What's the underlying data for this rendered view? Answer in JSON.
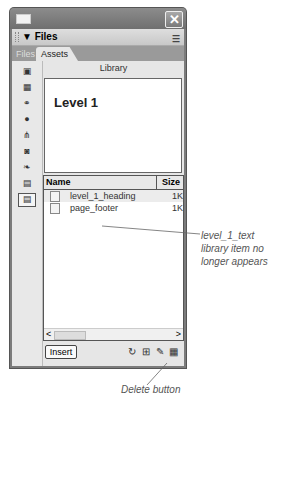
{
  "window": {
    "close_glyph": "✕"
  },
  "panel": {
    "title": "▼ Files",
    "options_glyph": "☰"
  },
  "tabs": [
    {
      "label": "Files",
      "active": false
    },
    {
      "label": "Assets",
      "active": true
    }
  ],
  "sidebar": {
    "icons": [
      {
        "name": "images-icon",
        "glyph": "▣"
      },
      {
        "name": "colors-icon",
        "glyph": "▦"
      },
      {
        "name": "urls-icon",
        "glyph": "⚭"
      },
      {
        "name": "flash-icon",
        "glyph": "●"
      },
      {
        "name": "shockwave-icon",
        "glyph": "⋔"
      },
      {
        "name": "movies-icon",
        "glyph": "◙"
      },
      {
        "name": "scripts-icon",
        "glyph": "❧"
      },
      {
        "name": "templates-icon",
        "glyph": "▤"
      },
      {
        "name": "library-icon",
        "glyph": "📖"
      }
    ]
  },
  "library": {
    "label": "Library",
    "preview_text": "Level 1",
    "columns": {
      "name": "Name",
      "size": "Size"
    },
    "items": [
      {
        "name": "level_1_heading",
        "size": "1K",
        "selected": true
      },
      {
        "name": "page_footer",
        "size": "1K",
        "selected": false
      }
    ],
    "scroll_left": "<",
    "scroll_thumb": "III",
    "scroll_right": ">"
  },
  "bottom_bar": {
    "insert_label": "Insert",
    "refresh_glyph": "↻",
    "new_item_glyph": "⊞",
    "edit_glyph": "✎",
    "delete_glyph": "🗑"
  },
  "annotations": {
    "callout_1": "level_1_text\nlibrary item no\nlonger appears",
    "callout_1_lines": [
      "level_1_text",
      "library item no",
      "longer appears"
    ],
    "callout_2": "Delete button"
  }
}
